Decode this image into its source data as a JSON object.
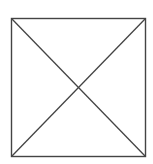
{
  "diagram": {
    "shape": "square-with-diagonals",
    "stroke_color": "#444444",
    "background": "#ffffff",
    "square": {
      "x1": 11.5,
      "y1": 18.5,
      "x2": 145.5,
      "y2": 156.5
    }
  }
}
